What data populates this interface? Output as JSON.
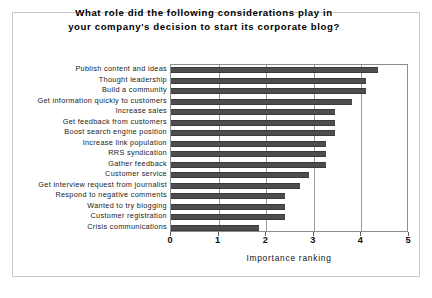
{
  "chart_data": {
    "type": "bar",
    "orientation": "horizontal",
    "title": "What role did the following considerations play in your company's decision to start its corporate blog?",
    "title_lines": [
      "What role did the following considerations play in",
      "your company's decision to start its corporate blog?"
    ],
    "xlabel": "Importance ranking",
    "ylabel": "",
    "xlim": [
      0,
      5
    ],
    "xticks": [
      0,
      1,
      2,
      3,
      4,
      5
    ],
    "xtick_labels": [
      "0",
      "1",
      "2",
      "3",
      "4",
      "5"
    ],
    "grid": true,
    "legend": "none",
    "bar_color": "#4d4d4d",
    "categories": [
      "Publish content and ideas",
      "Thought leadership",
      "Build a community",
      "Get information quickly to customers",
      "Increase sales",
      "Get feedback from customers",
      "Boost search engine position",
      "Increase link population",
      "RRS syndication",
      "Gather feedback",
      "Customer service",
      "Get interview request from journalist",
      "Respond to negative comments",
      "Wanted to try blogging",
      "Customer registration",
      "Crisis communications"
    ],
    "values": [
      4.35,
      4.1,
      4.1,
      3.8,
      3.45,
      3.45,
      3.45,
      3.25,
      3.25,
      3.25,
      2.9,
      2.7,
      2.4,
      2.4,
      2.4,
      1.85
    ]
  }
}
